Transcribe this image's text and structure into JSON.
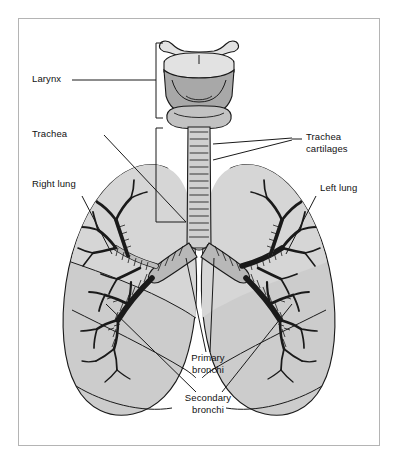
{
  "figure": {
    "type": "anatomical-diagram",
    "frame": {
      "border_color": "#b4b4b4",
      "background": "#ffffff"
    }
  },
  "colors": {
    "lung_fill": "#cccccc",
    "lung_upper_lobe_fill": "#d4d4d4",
    "cartilage_dark": "#a8a8a8",
    "cartilage_light": "#d8d8d8",
    "outline": "#1a1a1a",
    "label_text": "#111111",
    "leader_line": "#1a1a1a",
    "page_background": "#ffffff"
  },
  "labels": [
    {
      "id": "larynx",
      "text": "Larynx",
      "side": "left"
    },
    {
      "id": "trachea",
      "text": "Trachea",
      "side": "left"
    },
    {
      "id": "right-lung",
      "text": "Right lung",
      "side": "left"
    },
    {
      "id": "trachea-cartilages-1",
      "text": "Trachea",
      "side": "right"
    },
    {
      "id": "trachea-cartilages-2",
      "text": "cartilages",
      "side": "right"
    },
    {
      "id": "left-lung",
      "text": "Left lung",
      "side": "right"
    },
    {
      "id": "primary-bronchi-1",
      "text": "Primary",
      "side": "bottom"
    },
    {
      "id": "primary-bronchi-2",
      "text": "bronchi",
      "side": "bottom"
    },
    {
      "id": "secondary-bronchi-1",
      "text": "Secondary",
      "side": "bottom"
    },
    {
      "id": "secondary-bronchi-2",
      "text": "bronchi",
      "side": "bottom"
    }
  ],
  "structures": [
    {
      "name": "larynx",
      "label": "Larynx"
    },
    {
      "name": "hyoid-bone",
      "label": "Hyoid bone"
    },
    {
      "name": "thyroid-cartilage",
      "label": "Thyroid cartilage"
    },
    {
      "name": "cricoid-cartilage",
      "label": "Cricoid cartilage"
    },
    {
      "name": "trachea",
      "label": "Trachea"
    },
    {
      "name": "trachea-cartilages",
      "label": "Trachea cartilages"
    },
    {
      "name": "right-lung",
      "label": "Right lung"
    },
    {
      "name": "left-lung",
      "label": "Left lung"
    },
    {
      "name": "primary-bronchi",
      "label": "Primary bronchi"
    },
    {
      "name": "secondary-bronchi",
      "label": "Secondary bronchi"
    }
  ]
}
